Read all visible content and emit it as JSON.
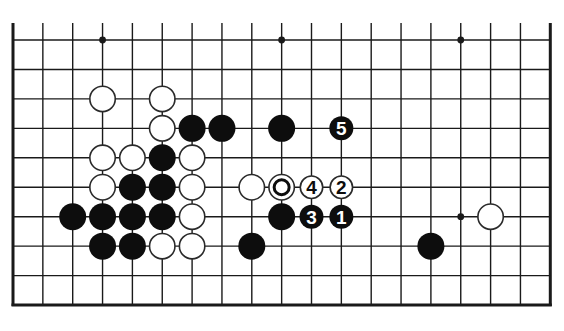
{
  "diagram": {
    "type": "go-board-partial",
    "columns": 19,
    "rows": 10,
    "origin": {
      "x": 13,
      "y": 40
    },
    "spacing": {
      "x": 29.85,
      "y": 29.45
    },
    "top_line_extension": 17,
    "edges": {
      "left": true,
      "right": true,
      "bottom": true,
      "top": false
    },
    "stone_radius": 13.5,
    "colors": {
      "background": "#ffffff",
      "line": "#1a1a1a",
      "black_stone": "#0d0d0d",
      "white_stone_fill": "#ffffff",
      "white_stone_stroke": "#2a2a2a",
      "label_on_black": "#ffffff",
      "label_on_white": "#0d0d0d"
    },
    "hoshi": [
      {
        "c": 3,
        "r": 0
      },
      {
        "c": 9,
        "r": 0
      },
      {
        "c": 15,
        "r": 0
      },
      {
        "c": 15,
        "r": 6
      }
    ],
    "stones": [
      {
        "c": 3,
        "r": 2,
        "color": "white"
      },
      {
        "c": 5,
        "r": 2,
        "color": "white"
      },
      {
        "c": 5,
        "r": 3,
        "color": "white"
      },
      {
        "c": 6,
        "r": 3,
        "color": "black"
      },
      {
        "c": 7,
        "r": 3,
        "color": "black"
      },
      {
        "c": 9,
        "r": 3,
        "color": "black"
      },
      {
        "c": 11,
        "r": 3,
        "color": "black",
        "label": "5"
      },
      {
        "c": 3,
        "r": 4,
        "color": "white"
      },
      {
        "c": 4,
        "r": 4,
        "color": "white"
      },
      {
        "c": 5,
        "r": 4,
        "color": "black"
      },
      {
        "c": 6,
        "r": 4,
        "color": "white"
      },
      {
        "c": 3,
        "r": 5,
        "color": "white"
      },
      {
        "c": 4,
        "r": 5,
        "color": "black"
      },
      {
        "c": 5,
        "r": 5,
        "color": "black"
      },
      {
        "c": 6,
        "r": 5,
        "color": "white"
      },
      {
        "c": 8,
        "r": 5,
        "color": "white"
      },
      {
        "c": 9,
        "r": 5,
        "color": "white",
        "marker": "circle"
      },
      {
        "c": 10,
        "r": 5,
        "color": "white",
        "label": "4"
      },
      {
        "c": 11,
        "r": 5,
        "color": "white",
        "label": "2"
      },
      {
        "c": 2,
        "r": 6,
        "color": "black"
      },
      {
        "c": 3,
        "r": 6,
        "color": "black"
      },
      {
        "c": 4,
        "r": 6,
        "color": "black"
      },
      {
        "c": 5,
        "r": 6,
        "color": "black"
      },
      {
        "c": 6,
        "r": 6,
        "color": "white"
      },
      {
        "c": 9,
        "r": 6,
        "color": "black"
      },
      {
        "c": 10,
        "r": 6,
        "color": "black",
        "label": "3"
      },
      {
        "c": 11,
        "r": 6,
        "color": "black",
        "label": "1"
      },
      {
        "c": 16,
        "r": 6,
        "color": "white"
      },
      {
        "c": 3,
        "r": 7,
        "color": "black"
      },
      {
        "c": 4,
        "r": 7,
        "color": "black"
      },
      {
        "c": 5,
        "r": 7,
        "color": "white"
      },
      {
        "c": 6,
        "r": 7,
        "color": "white"
      },
      {
        "c": 8,
        "r": 7,
        "color": "black"
      },
      {
        "c": 14,
        "r": 7,
        "color": "black"
      }
    ]
  }
}
